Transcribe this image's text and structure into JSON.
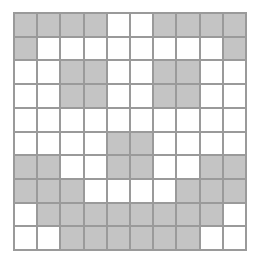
{
  "grid": {
    "rows": 10,
    "cols": 10,
    "colors": {
      "filled": "#c4c4c4",
      "empty": "#ffffff",
      "line": "#9a9a9a"
    },
    "cells": [
      [
        1,
        1,
        1,
        1,
        0,
        0,
        1,
        1,
        1,
        1
      ],
      [
        1,
        0,
        0,
        0,
        0,
        0,
        0,
        0,
        0,
        1
      ],
      [
        0,
        0,
        1,
        1,
        0,
        0,
        1,
        1,
        0,
        0
      ],
      [
        0,
        0,
        1,
        1,
        0,
        0,
        1,
        1,
        0,
        0
      ],
      [
        0,
        0,
        0,
        0,
        0,
        0,
        0,
        0,
        0,
        0
      ],
      [
        0,
        0,
        0,
        0,
        1,
        1,
        0,
        0,
        0,
        0
      ],
      [
        1,
        1,
        0,
        0,
        1,
        1,
        0,
        0,
        1,
        1
      ],
      [
        1,
        1,
        1,
        0,
        0,
        0,
        0,
        1,
        1,
        1
      ],
      [
        0,
        1,
        1,
        1,
        1,
        1,
        1,
        1,
        1,
        0
      ],
      [
        0,
        0,
        1,
        1,
        1,
        1,
        1,
        1,
        0,
        0
      ]
    ]
  }
}
